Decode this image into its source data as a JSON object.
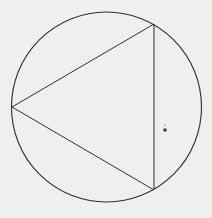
{
  "figure": {
    "canvas": {
      "width": 212,
      "height": 218,
      "background": "#efefed"
    },
    "stroke_color": "#2e2e2e",
    "circle": {
      "cx": 106.5,
      "cy": 107,
      "r": 95
    },
    "triangle": {
      "vertices": [
        {
          "name": "top-right",
          "x": 154,
          "y": 24
        },
        {
          "name": "left",
          "x": 12,
          "y": 107
        },
        {
          "name": "bottom-right",
          "x": 154,
          "y": 190
        }
      ]
    },
    "speck": {
      "x": 165,
      "y": 130,
      "r": 1.8
    }
  }
}
